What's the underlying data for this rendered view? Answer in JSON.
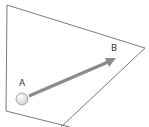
{
  "diagram": {
    "point_a": {
      "label": "A",
      "x": 22,
      "y": 99
    },
    "point_b": {
      "label": "B",
      "x": 114,
      "y": 48
    },
    "colors": {
      "outline": "#7a7a7a",
      "arrow": "#8c8c8c",
      "circle_fill": "#eeeeee",
      "circle_stroke": "#999999",
      "text": "#333333"
    }
  }
}
